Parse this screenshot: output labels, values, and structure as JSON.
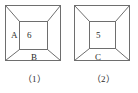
{
  "page": {
    "background_color": "#ffffff",
    "line_color": "#6e6e6e",
    "text_color": "#2b2b2b"
  },
  "figures": [
    {
      "id": "figure-1",
      "caption": "（1）",
      "outer_square": {
        "x": 5,
        "y": 5,
        "size": 56
      },
      "inner_square": {
        "x": 19,
        "y": 21,
        "width": 28,
        "height": 29
      },
      "labels": [
        {
          "name": "label-a",
          "text": "A",
          "region": "left-trapezoid"
        },
        {
          "name": "label-6",
          "text": "6",
          "region": "inner-square"
        },
        {
          "name": "label-b",
          "text": "B",
          "region": "bottom-trapezoid"
        }
      ]
    },
    {
      "id": "figure-2",
      "caption": "（2）",
      "outer_square": {
        "x": 5,
        "y": 5,
        "size": 56
      },
      "inner_square": {
        "x": 20,
        "y": 21,
        "width": 26,
        "height": 28
      },
      "labels": [
        {
          "name": "label-5",
          "text": "5",
          "region": "inner-square"
        },
        {
          "name": "label-c",
          "text": "C",
          "region": "bottom-trapezoid"
        }
      ]
    }
  ]
}
